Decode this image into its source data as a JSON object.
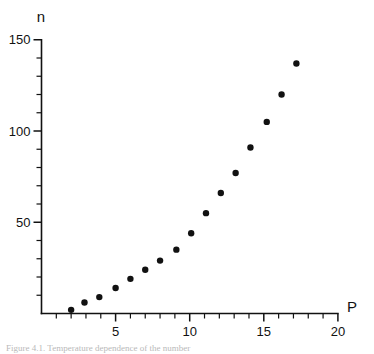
{
  "figure": {
    "caption": "Figure 4.1. Temperature dependence of the number"
  },
  "chart_data": {
    "type": "scatter",
    "title": "",
    "subtitle": "",
    "xlabel": "P",
    "ylabel": "n",
    "xlim": [
      0,
      20
    ],
    "ylim": [
      0,
      150
    ],
    "grid": false,
    "legend": null,
    "x_ticks_major": [
      5,
      10,
      15,
      20
    ],
    "x_tick_labels": [
      "5",
      "10",
      "15",
      "20"
    ],
    "x_ticks_minor": [
      1,
      2,
      3,
      4,
      6,
      7,
      8,
      9,
      11,
      12,
      13,
      14,
      16,
      17,
      18,
      19
    ],
    "y_ticks_major": [
      50,
      100,
      150
    ],
    "y_tick_labels": [
      "50",
      "100",
      "150"
    ],
    "y_ticks_minor": [
      10,
      20,
      30,
      40,
      60,
      70,
      80,
      90,
      110,
      120,
      130,
      140
    ],
    "marker": "filled-circle",
    "marker_color": "#111111",
    "marker_size": 3.2,
    "series": [
      {
        "name": "n vs P",
        "points": [
          {
            "x": 2.0,
            "y": 2
          },
          {
            "x": 2.9,
            "y": 6
          },
          {
            "x": 3.9,
            "y": 9
          },
          {
            "x": 5.0,
            "y": 14
          },
          {
            "x": 6.0,
            "y": 19
          },
          {
            "x": 7.0,
            "y": 24
          },
          {
            "x": 8.0,
            "y": 29
          },
          {
            "x": 9.1,
            "y": 35
          },
          {
            "x": 10.1,
            "y": 44
          },
          {
            "x": 11.1,
            "y": 55
          },
          {
            "x": 12.1,
            "y": 66
          },
          {
            "x": 13.1,
            "y": 77
          },
          {
            "x": 14.1,
            "y": 91
          },
          {
            "x": 15.2,
            "y": 105
          },
          {
            "x": 16.2,
            "y": 120
          },
          {
            "x": 17.2,
            "y": 137
          }
        ]
      }
    ]
  }
}
